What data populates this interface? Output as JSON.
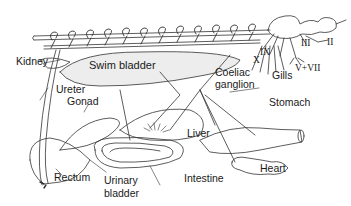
{
  "diagram": {
    "labels": {
      "kidney": "Kidney",
      "swim_bladder": "Swim bladder",
      "ureter": "Ureter",
      "gonad": "Gonad",
      "coeliac": "Coeliac",
      "ganglion": "ganglion",
      "gills": "Gills",
      "stomach": "Stomach",
      "liver": "Liver",
      "rectum": "Rectum",
      "urinary": "Urinary",
      "bladder": "bladder",
      "intestine": "Intestine",
      "heart": "Heart"
    },
    "cranial_nerves": {
      "x": "X",
      "ix": "IX",
      "iii": "III",
      "ii": "II",
      "v_vii": "V+VII"
    },
    "colors": {
      "line": "#333333",
      "text": "#1a1a1a",
      "stipple": "#cfcfcf"
    }
  }
}
